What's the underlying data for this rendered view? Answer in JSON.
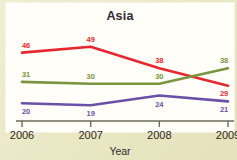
{
  "chart_data": {
    "type": "line",
    "title": "Asia",
    "xlabel": "Year",
    "ylabel": "",
    "categories": [
      "2006",
      "2007",
      "2008",
      "2009"
    ],
    "x": [
      2006,
      2007,
      2008,
      2009
    ],
    "xlim": [
      2006,
      2009
    ],
    "ylim": [
      14,
      54
    ],
    "grid": false,
    "legend": "none",
    "series": [
      {
        "name": "red-series",
        "color": "#e8262f",
        "values": [
          46,
          49,
          38,
          29
        ],
        "labels": [
          "46",
          "49",
          "38",
          "29"
        ]
      },
      {
        "name": "green-series",
        "color": "#7a9440",
        "values": [
          31,
          30,
          30,
          38
        ],
        "labels": [
          "31",
          "30",
          "30",
          "38"
        ]
      },
      {
        "name": "purple-series",
        "color": "#6a50a7",
        "values": [
          20,
          19,
          24,
          21
        ],
        "labels": [
          "20",
          "19",
          "24",
          "21"
        ]
      }
    ]
  },
  "canvas": {
    "background": "#eae8c8",
    "card_background": "#fffef8",
    "axis_color": "#6b6b5a"
  }
}
